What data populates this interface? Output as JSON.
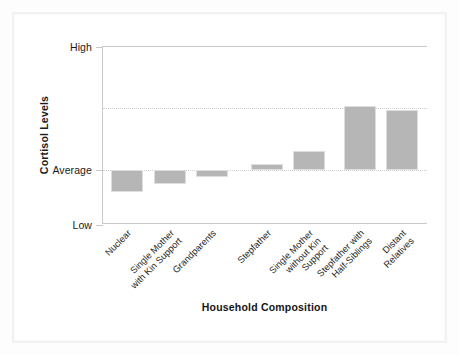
{
  "chart_data": {
    "type": "bar",
    "title": "",
    "xlabel": "Household Composition",
    "ylabel": "Cortisol Levels",
    "categories": [
      "Nuclear",
      "Single Mother with Kin Support",
      "Grandparents",
      "Stepfather",
      "Single Mother without Kin Support",
      "Stepfather with Half-Siblings",
      "Distant Relatives"
    ],
    "category_lines": [
      [
        "Nuclear"
      ],
      [
        "Single Mother",
        "with Kin Support"
      ],
      [
        "Grandparents"
      ],
      [
        "Stepfather"
      ],
      [
        "Single Mother",
        "without Kin",
        "Support"
      ],
      [
        "Stepfather with",
        "Half-Siblings"
      ],
      [
        "Distant",
        "Relatives"
      ]
    ],
    "values": [
      -0.18,
      -0.12,
      -0.06,
      0.05,
      0.15,
      0.52,
      0.49
    ],
    "ytick_labels": [
      "High",
      "Average",
      "Low"
    ],
    "ytick_positions": [
      1.0,
      0.0,
      -0.45
    ],
    "ylim": [
      -0.45,
      1.0
    ],
    "gridlines": [
      0.5,
      0.0
    ],
    "grid": true,
    "legend": "none",
    "bar_color": "#b6b6b6",
    "axis_color": "#c9c9c9",
    "grid_color": "#cfcfcf"
  },
  "page": {
    "background": "#ffffff",
    "frame_color": "#f2f2f2"
  }
}
